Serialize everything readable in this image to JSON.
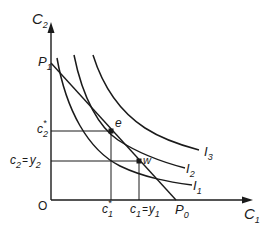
{
  "diagram": {
    "type": "indifference-curve",
    "axes": {
      "origin_label": "O",
      "x_axis": {
        "label": "C",
        "sub": "1"
      },
      "y_axis": {
        "label": "C",
        "sub": "2"
      }
    },
    "budget_line": {
      "start": {
        "label": "P",
        "sub": "1"
      },
      "end": {
        "label": "P",
        "sub": "0"
      }
    },
    "indifference_curves": [
      {
        "label": "I",
        "sub": "1"
      },
      {
        "label": "I",
        "sub": "2"
      },
      {
        "label": "I",
        "sub": "3"
      }
    ],
    "points": {
      "e": {
        "label": "e"
      },
      "w": {
        "label": "w"
      }
    },
    "y_ticks": {
      "c2_star": {
        "label": "c",
        "sub": "2",
        "sup": "*"
      },
      "c2_eq_y2": {
        "label": "c",
        "sub": "2",
        "eq": "=",
        "rhs": "y",
        "rhs_sub": "2"
      }
    },
    "x_ticks": {
      "c1_star": {
        "label": "c",
        "sub": "1",
        "sup": "*"
      },
      "c1_eq_y1": {
        "label": "c",
        "sub": "1",
        "eq": "=",
        "rhs": "y",
        "rhs_sub": "1"
      }
    },
    "colors": {
      "ink": "#1a1a1a",
      "background": "#ffffff"
    }
  }
}
